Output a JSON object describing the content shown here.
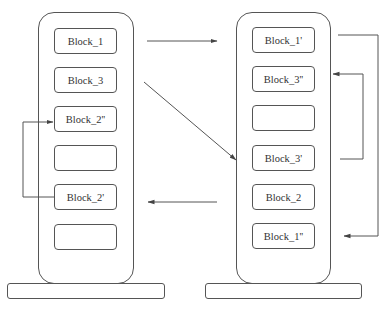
{
  "diagram": {
    "left_stack": {
      "blocks": [
        {
          "label": "Block_1"
        },
        {
          "label": "Block_3"
        },
        {
          "label": "Block_2''"
        },
        {
          "label": ""
        },
        {
          "label": "Block_2'"
        },
        {
          "label": ""
        }
      ]
    },
    "right_stack": {
      "blocks": [
        {
          "label": "Block_1'"
        },
        {
          "label": "Block_3''"
        },
        {
          "label": ""
        },
        {
          "label": "Block_3'"
        },
        {
          "label": "Block_2"
        },
        {
          "label": "Block_1''"
        }
      ]
    },
    "arrows": [
      {
        "from": "Block_1",
        "to": "Block_1'"
      },
      {
        "from": "Block_3",
        "to": "Block_3'"
      },
      {
        "from": "Block_2",
        "to": "Block_2'"
      },
      {
        "from": "Block_2'",
        "to": "Block_2''"
      },
      {
        "from": "Block_3'",
        "to": "Block_3''"
      },
      {
        "from": "Block_1'",
        "to": "Block_1''"
      }
    ],
    "colors": {
      "stroke": "#555555",
      "text": "#333333",
      "background": "#ffffff"
    }
  }
}
